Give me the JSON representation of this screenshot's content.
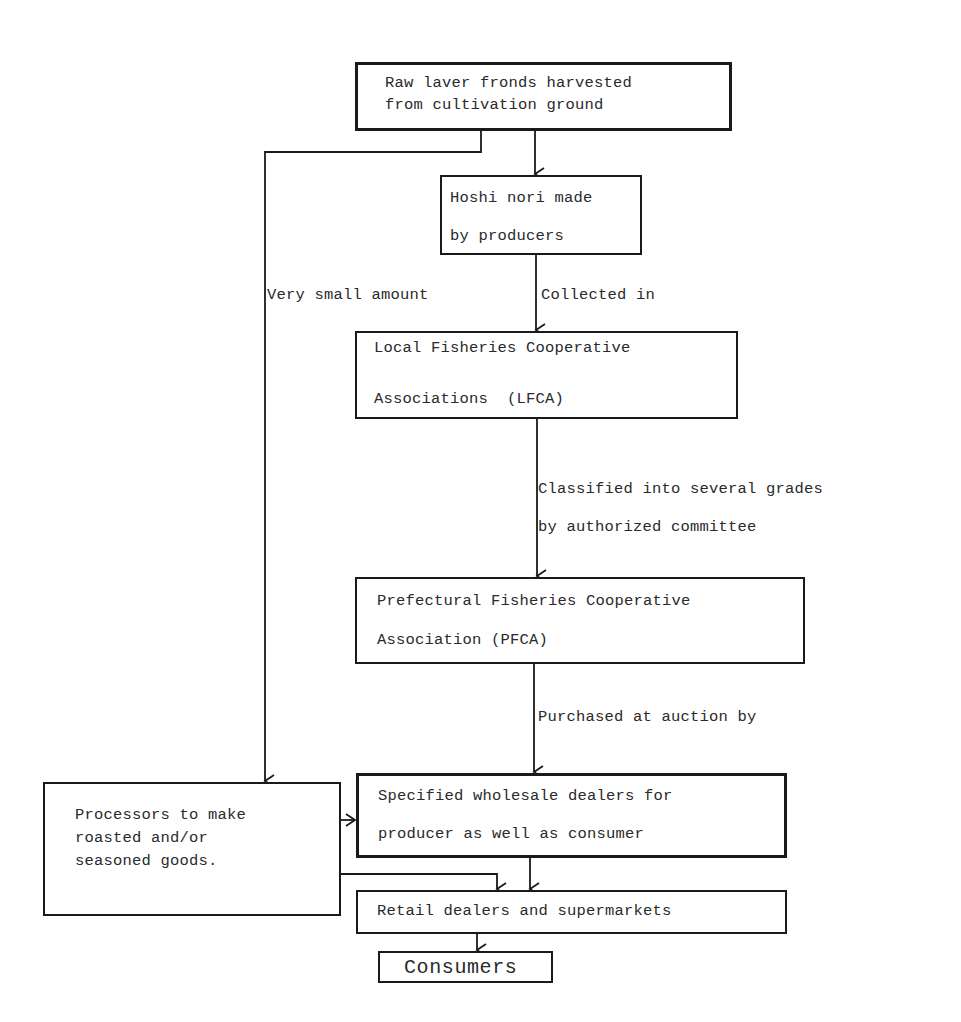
{
  "diagram": {
    "type": "flowchart",
    "nodes": {
      "raw": {
        "line1": "Raw laver fronds harvested",
        "line2": "from cultivation ground"
      },
      "hoshi": {
        "line1": "Hoshi nori made",
        "line2": "by producers"
      },
      "lfca": {
        "line1": "Local Fisheries Cooperative",
        "line2": "Associations  (LFCA)"
      },
      "pfca": {
        "line1": "Prefectural Fisheries Cooperative",
        "line2": "Association (PFCA)"
      },
      "wholesale": {
        "line1": "Specified wholesale dealers for",
        "line2": "producer as well as consumer"
      },
      "processors": {
        "line1": "Processors to make",
        "line2": "roasted and/or",
        "line3": "seasoned goods."
      },
      "retail": {
        "line1": "Retail dealers and supermarkets"
      },
      "consumers": {
        "line1": "Consumers"
      }
    },
    "edge_labels": {
      "very_small": "Very small amount",
      "collected": "Collected in",
      "classified1": "Classified into several grades",
      "classified2": "by authorized committee",
      "purchased": "Purchased at auction by"
    },
    "edges": [
      {
        "from": "raw",
        "to": "hoshi"
      },
      {
        "from": "raw",
        "to": "processors",
        "label": "Very small amount"
      },
      {
        "from": "hoshi",
        "to": "lfca",
        "label": "Collected in"
      },
      {
        "from": "lfca",
        "to": "pfca",
        "label": "Classified into several grades by authorized committee"
      },
      {
        "from": "pfca",
        "to": "wholesale",
        "label": "Purchased at auction by"
      },
      {
        "from": "processors",
        "to": "wholesale"
      },
      {
        "from": "processors",
        "to": "retail"
      },
      {
        "from": "wholesale",
        "to": "retail"
      },
      {
        "from": "retail",
        "to": "consumers"
      }
    ],
    "colors": {
      "ink": "#1a1a1a",
      "background": "#ffffff"
    }
  }
}
